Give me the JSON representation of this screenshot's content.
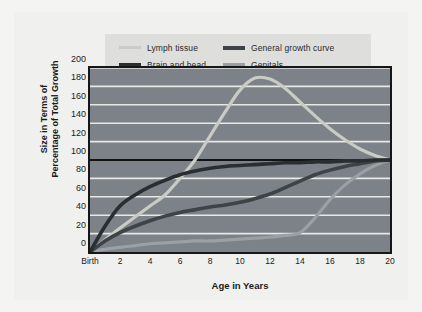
{
  "legend": {
    "items": [
      {
        "label": "Lymph tissue",
        "color": "#c9cbc4",
        "width": 3,
        "icon": "line-swatch-lymph"
      },
      {
        "label": "General growth curve",
        "color": "#3d4347",
        "width": 4,
        "icon": "line-swatch-general"
      },
      {
        "label": "Brain and head",
        "color": "#2a2e31",
        "width": 4,
        "icon": "line-swatch-brain"
      },
      {
        "label": "Genitals",
        "color": "#9aa0a3",
        "width": 3.5,
        "icon": "line-swatch-genitals"
      }
    ]
  },
  "axes": {
    "ylabel_line1": "Size in Terms of",
    "ylabel_line2": "Percentage of Total Growth",
    "xlabel": "Age in Years",
    "yticks": [
      0,
      20,
      40,
      60,
      80,
      100,
      120,
      140,
      160,
      180,
      200
    ],
    "xticks": [
      "Birth",
      "2",
      "4",
      "6",
      "8",
      "10",
      "12",
      "14",
      "16",
      "18",
      "20"
    ]
  },
  "style": {
    "plot_background": "#7d8188",
    "gridline_color": "#e8e8e4",
    "frame_color": "#161616",
    "reference_line_color": "#121212",
    "legend_background": "#dededc",
    "card_background": "#f0f0ee",
    "page_background": "#f4f4f2"
  },
  "chart_data": {
    "type": "line",
    "title": "",
    "xlabel": "Age in Years",
    "ylabel": "Size in Terms of Percentage of Total Growth",
    "xlim": [
      0,
      20
    ],
    "ylim": [
      0,
      200
    ],
    "grid": true,
    "legend_position": "top",
    "reference_line_y": 100,
    "x": [
      0,
      1,
      2,
      3,
      4,
      5,
      6,
      7,
      8,
      9,
      10,
      11,
      12,
      13,
      14,
      15,
      16,
      17,
      18,
      19,
      20
    ],
    "series": [
      {
        "name": "Lymph tissue",
        "color": "#c9cbc4",
        "values": [
          0,
          13,
          26,
          38,
          50,
          62,
          80,
          100,
          126,
          152,
          176,
          189,
          188,
          178,
          163,
          148,
          134,
          122,
          112,
          105,
          100
        ]
      },
      {
        "name": "Brain and head",
        "color": "#2a2e31",
        "values": [
          0,
          28,
          50,
          62,
          71,
          78,
          84,
          88,
          91,
          93,
          94,
          95,
          96,
          97,
          97,
          98,
          98,
          99,
          99,
          100,
          100
        ]
      },
      {
        "name": "General growth curve",
        "color": "#3d4347",
        "values": [
          0,
          12,
          21,
          28,
          34,
          39,
          43,
          46,
          49,
          51,
          54,
          58,
          63,
          70,
          77,
          84,
          89,
          93,
          96,
          99,
          100
        ]
      },
      {
        "name": "Genitals",
        "color": "#9aa0a3",
        "values": [
          0,
          3,
          5,
          7,
          9,
          10,
          11,
          12,
          12,
          13,
          14,
          15,
          16,
          18,
          21,
          37,
          57,
          73,
          85,
          94,
          100
        ]
      }
    ]
  }
}
